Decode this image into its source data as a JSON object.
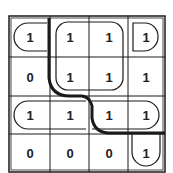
{
  "kmap": {
    "rows": 4,
    "cols": 4,
    "cells": [
      [
        "1",
        "1",
        "1",
        "1"
      ],
      [
        "0",
        "1",
        "1",
        "1"
      ],
      [
        "1",
        "1",
        "1",
        "1"
      ],
      [
        "0",
        "0",
        "0",
        "1"
      ]
    ]
  },
  "colors": {
    "line": "#1a1a1a",
    "background": "#ffffff"
  }
}
